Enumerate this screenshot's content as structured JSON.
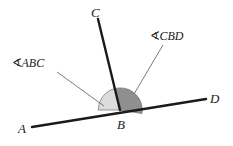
{
  "figure": {
    "type": "geometry-diagram",
    "background_color": "#ffffff",
    "stroke_color": "#1a1a1a",
    "leader_color": "#6b6b6b"
  },
  "points": {
    "A": {
      "label": "A",
      "x": 18,
      "y": 130
    },
    "B": {
      "label": "B",
      "x": 117,
      "y": 126
    },
    "C": {
      "label": "C",
      "x": 91,
      "y": 16
    },
    "D": {
      "label": "D",
      "x": 210,
      "y": 102
    }
  },
  "vertex": {
    "x": 120,
    "y": 110
  },
  "rays": {
    "BA": {
      "from": [
        120,
        110
      ],
      "to": [
        32,
        127
      ]
    },
    "BD": {
      "from": [
        120,
        110
      ],
      "to": [
        206,
        99
      ]
    },
    "BC": {
      "from": [
        120,
        110
      ],
      "to": [
        98,
        19
      ]
    }
  },
  "angles": [
    {
      "name": "ABC",
      "label_symbol": "∢",
      "label_text": "ABC",
      "fill_color": "#dcdcdc",
      "label_x": 12,
      "label_y": 57,
      "leader_from": [
        57,
        72
      ],
      "leader_to": [
        104,
        106
      ]
    },
    {
      "name": "CBD",
      "label_symbol": "∢",
      "label_text": "CBD",
      "fill_color": "#8f8f8f",
      "label_x": 150,
      "label_y": 30,
      "leader_from": [
        163,
        45
      ],
      "leader_to": [
        134,
        94
      ]
    }
  ],
  "arc": {
    "radius": 22,
    "stroke_color": "#5a5a5a"
  }
}
